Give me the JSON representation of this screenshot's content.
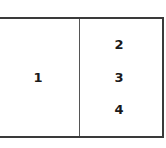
{
  "diagram": {
    "left_panel": {
      "label": "1"
    },
    "right_panel": {
      "labels": [
        "2",
        "3",
        "4"
      ]
    }
  }
}
